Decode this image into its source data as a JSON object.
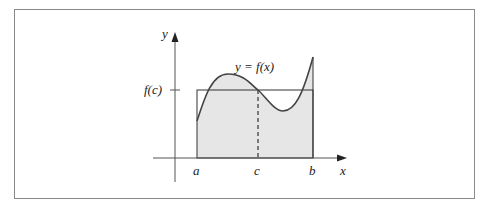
{
  "figure": {
    "curve_label": "y = f(x)",
    "y_axis_label": "y",
    "x_axis_label": "x",
    "level_label": "f(c)",
    "x_ticks": [
      {
        "id": "a",
        "label": "a"
      },
      {
        "id": "c",
        "label": "c"
      },
      {
        "id": "b",
        "label": "b"
      }
    ],
    "colors": {
      "shade": "#e6e6e6",
      "stroke": "#333333",
      "axis": "#555555",
      "frame": "#8a8a8a"
    }
  }
}
